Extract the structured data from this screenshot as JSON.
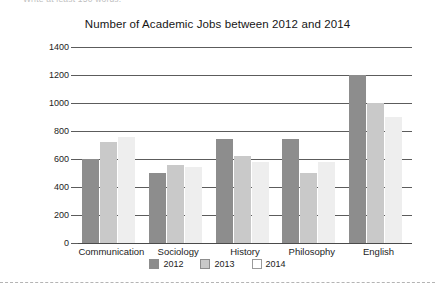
{
  "page": {
    "clipped_instruction": "Write at least 150 words."
  },
  "separator": {
    "style": "dashed"
  },
  "chart_data": {
    "type": "bar",
    "title": "Number of Academic Jobs between 2012 and 2014",
    "xlabel": "",
    "ylabel": "",
    "ylim": [
      0,
      1400
    ],
    "ytick_step": 200,
    "yticks": [
      0,
      200,
      400,
      600,
      800,
      1000,
      1200,
      1400
    ],
    "grid": true,
    "legend_position": "bottom-center",
    "categories": [
      "Communication",
      "Sociology",
      "History",
      "Philosophy",
      "English"
    ],
    "series": [
      {
        "name": "2012",
        "color": "#8d8d8d",
        "values": [
          600,
          500,
          740,
          740,
          1200
        ]
      },
      {
        "name": "2013",
        "color": "#c9c9c9",
        "values": [
          720,
          560,
          620,
          500,
          1000
        ]
      },
      {
        "name": "2014",
        "color": "#eeeeee",
        "values": [
          760,
          540,
          580,
          580,
          900
        ]
      }
    ]
  }
}
